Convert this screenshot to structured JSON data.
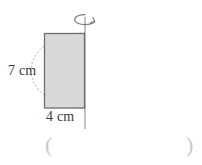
{
  "figure": {
    "type": "solid-of-revolution-diagram",
    "shape": {
      "name": "rectangle",
      "fill_color": "#d9d9d9",
      "stroke_color": "#6b6b6b",
      "width_label": "4 cm",
      "height_label": "7 cm",
      "width_value": 4,
      "height_value": 7,
      "units": "cm"
    },
    "axis": {
      "name": "axis-of-rotation",
      "orientation": "vertical",
      "stroke_color": "#8a8a8a"
    },
    "rotation_arrow": {
      "name": "rotation-arrow-icon",
      "direction": "clockwise-around-vertical-axis",
      "stroke_color": "#7a7a7a"
    },
    "sweep_arc": {
      "name": "rotation-sweep-arc",
      "style": "dotted",
      "stroke_color": "#b5b5b5"
    }
  },
  "labels": {
    "height": "7 cm",
    "width": "4 cm"
  },
  "answer": {
    "open_paren": "(",
    "close_paren": ")",
    "value": "",
    "placeholder": ""
  }
}
